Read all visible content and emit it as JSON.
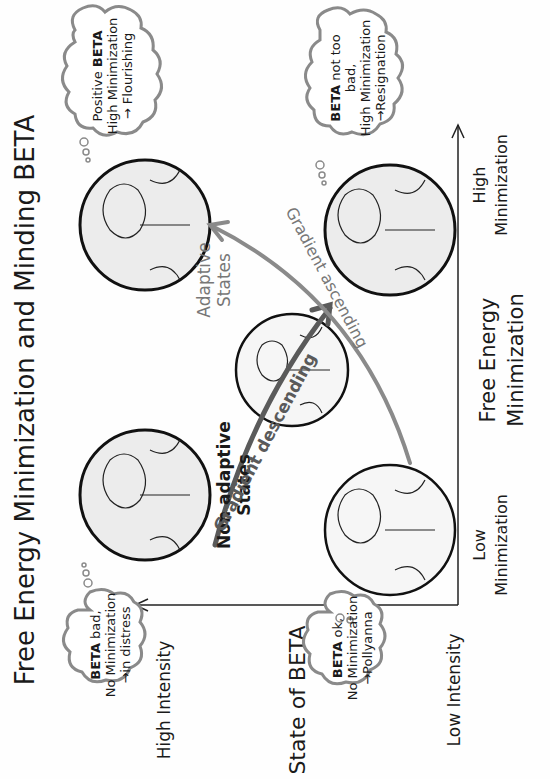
{
  "title": "Free Energy Minimization and Minding BETA",
  "y_axis": {
    "label": "State of BETA",
    "high": "High Intensity",
    "low": "Low Intensity"
  },
  "x_axis": {
    "label_line1": "Free Energy",
    "label_line2": "Minimization",
    "low_line1": "Low",
    "low_line2": "Minimization",
    "high_line1": "High",
    "high_line2": "Minimization"
  },
  "regions": {
    "non_adaptive_line1": "Non adaptive",
    "non_adaptive_line2": "States",
    "adaptive_line1": "Adaptive",
    "adaptive_line2": "States"
  },
  "arrows": {
    "descending": "Gradient descending",
    "ascending": "Gradient ascending"
  },
  "thoughts": {
    "distress": {
      "bold": "BETA",
      "line1_rest": " bad,",
      "line2": "No Minimization",
      "line3": "→in distress"
    },
    "pollyanna": {
      "bold": "BETA",
      "line1_rest": " ok,",
      "line2": "No Minimization",
      "line3": "→Pollyanna"
    },
    "flourishing": {
      "line1_pre": "Positive ",
      "bold": "BETA",
      "line2": "High Minimization",
      "line3": "→ Flourishing"
    },
    "resignation": {
      "bold": "BETA",
      "line1_rest": " not too",
      "line2": "bad,",
      "line3": "High Minimization",
      "line4": "→Resignation"
    }
  },
  "colors": {
    "ink": "#1a1a1a",
    "arrow_dark": "#5a5a5a",
    "arrow_light": "#8a8a8a",
    "shading": "#ececec"
  }
}
